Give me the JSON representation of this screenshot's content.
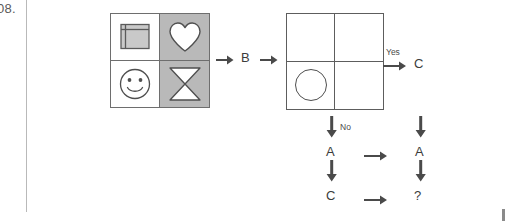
{
  "page": {
    "question_number": "08.",
    "margin_rule": "vertical-margin-rule"
  },
  "figure1": {
    "name": "input-grid",
    "cells": [
      {
        "position": "top-left",
        "shape": "square-frame",
        "background": "#ffffff",
        "icon": "square-frame-icon"
      },
      {
        "position": "top-right",
        "shape": "heart",
        "background": "#b9b9b9",
        "icon": "heart-icon"
      },
      {
        "position": "bottom-left",
        "shape": "smiley-face",
        "background": "#ffffff",
        "icon": "smiley-face-icon"
      },
      {
        "position": "bottom-right",
        "shape": "hourglass",
        "background": "#b9b9b9",
        "icon": "hourglass-icon"
      }
    ]
  },
  "figure2": {
    "name": "output-grid",
    "cells": [
      {
        "position": "top-left",
        "shape": "empty",
        "background": "#ffffff",
        "icon": ""
      },
      {
        "position": "top-right",
        "shape": "empty",
        "background": "#ffffff",
        "icon": ""
      },
      {
        "position": "bottom-left",
        "shape": "circle",
        "background": "#ffffff",
        "icon": "circle-icon"
      },
      {
        "position": "bottom-right",
        "shape": "empty",
        "background": "#ffffff",
        "icon": ""
      }
    ]
  },
  "flow": {
    "operator_b": "B",
    "yes_label": "Yes",
    "no_label": "No",
    "node_c_top": "C",
    "node_a_left": "A",
    "node_a_right": "A",
    "node_c_left": "C",
    "node_question": "?"
  },
  "colors": {
    "shaded_cell": "#b9b9b9",
    "grid_stroke": "#6e6e6e",
    "plain_grid_stroke": "#5d5d5d",
    "arrow": "#4a4a4a",
    "text": "#3c3c3c",
    "margin_rule": "#b9b9b9",
    "margin_number": "#5a5a5a"
  }
}
